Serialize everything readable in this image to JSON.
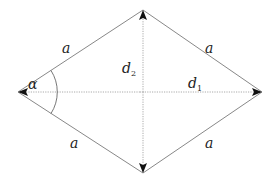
{
  "diagram": {
    "type": "rhombus",
    "vertices": {
      "top": [
        143,
        10
      ],
      "left": [
        18,
        92
      ],
      "right": [
        262,
        92
      ],
      "bottom": [
        143,
        173
      ]
    },
    "side_labels": [
      {
        "id": "top-left",
        "text": "a",
        "x": 66,
        "y": 52
      },
      {
        "id": "top-right",
        "text": "a",
        "x": 208,
        "y": 52
      },
      {
        "id": "bottom-left",
        "text": "a",
        "x": 72,
        "y": 146
      },
      {
        "id": "bottom-right",
        "text": "a",
        "x": 208,
        "y": 146
      }
    ],
    "diagonals": [
      {
        "id": "d1",
        "label": "d",
        "subscript": "1",
        "orientation": "horizontal",
        "x": 186,
        "y": 91
      },
      {
        "id": "d2",
        "label": "d",
        "subscript": "2",
        "orientation": "vertical",
        "x": 123,
        "y": 73
      }
    ],
    "angle": {
      "label": "α",
      "x": 40,
      "y": 86
    },
    "colors": {
      "edge": "#888888",
      "diagonal": "#aaaaaa",
      "arrow": "#111111",
      "text": "#222222"
    }
  }
}
